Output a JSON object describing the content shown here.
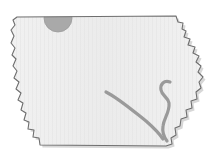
{
  "figure": {
    "type": "map",
    "region_kind": "us-state",
    "caption": "",
    "width": 212,
    "height": 157,
    "background_color": "#ffffff"
  },
  "style": {
    "land_fill": "#f1f1f1",
    "land_fill_alt": "#ebebeb",
    "outline_color": "#6e6e6e",
    "outline_width": 1.1,
    "shadow_color": "#c9c9c9",
    "river_color": "#9a9a9a",
    "river_width": 3.2,
    "marker_color": "#a9a9a9",
    "marker_stroke": "#9c9c9c"
  },
  "layers": [
    {
      "id": "state-outline",
      "label": "Iowa state boundary",
      "kind": "polygon"
    },
    {
      "id": "rivers",
      "label": "Rivers",
      "kind": "line"
    },
    {
      "id": "markers",
      "label": "Location marker",
      "kind": "point"
    }
  ],
  "markers": [
    {
      "id": "north-marker",
      "label": "",
      "shape": "circle",
      "cx": 58,
      "cy": 18,
      "r": 14,
      "clipped_by": "state-outline",
      "color": "#a9a9a9"
    }
  ],
  "rivers": [
    {
      "id": "des-moines-river",
      "label": "",
      "path": "M 106 92 C 118 98 132 110 146 121 C 154 128 159 133 163 139"
    },
    {
      "id": "eastern-river",
      "label": "",
      "path": "M 170 82 C 164 80 160 84 161 90 C 162 96 168 97 169 103 C 170 112 164 118 163 126 C 162 132 164 137 167 141"
    }
  ],
  "geometry": {
    "state_path": "M 17 17 L 176 16 L 178 22 L 183 23 L 182 29 L 186 31 L 184 37 L 190 39 L 188 45 L 195 47 L 193 53 L 199 56 L 196 62 L 201 66 L 198 72 L 203 77 L 199 82 L 201 88 L 196 92 L 197 99 L 191 101 L 192 108 L 186 110 L 187 117 L 181 119 L 180 126 L 175 128 L 176 135 L 171 138 L 172 144 L 166 146 L 40 145 L 39 138 L 33 137 L 34 130 L 28 129 L 29 122 L 24 120 L 26 113 L 21 110 L 23 103 L 18 100 L 21 93 L 16 89 L 19 82 L 14 78 L 17 71 L 13 66 L 16 59 L 12 55 L 15 48 L 11 43 L 14 36 L 11 30 L 15 25 L 13 20 Z"
  }
}
